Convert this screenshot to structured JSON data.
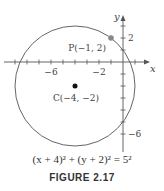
{
  "figure": {
    "caption": "FIGURE 2.17",
    "equation": "(x + 4)² + (y + 2)² = 5²",
    "axes": {
      "x_label": "x",
      "y_label": "y",
      "x_tick_labels": [
        "−6",
        "−2"
      ],
      "y_tick_labels": [
        "2",
        "−6"
      ]
    },
    "points": {
      "P": {
        "label": "P(−1, 2)",
        "x": -1,
        "y": 2,
        "color": "#888888"
      },
      "C": {
        "label": "C(−4, −2)",
        "x": -4,
        "y": -2,
        "color": "#111111"
      }
    },
    "circle": {
      "center": [
        -4,
        -2
      ],
      "radius": 5,
      "stroke": "#666666"
    }
  }
}
